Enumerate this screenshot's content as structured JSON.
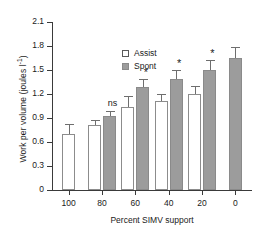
{
  "chart_data": {
    "type": "bar",
    "title": "",
    "xlabel": "Percent SIMV support",
    "ylabel": "Work per volume (joules l",
    "ylabel_sup": "-1",
    "ylabel_suffix": ")",
    "categories": [
      "100",
      "80",
      "60",
      "40",
      "20",
      "0"
    ],
    "ylim": [
      0,
      2.1
    ],
    "yticks": [
      "0",
      "0.3",
      "0.6",
      "0.9",
      "1.2",
      "1.5",
      "1.8",
      "2.1"
    ],
    "ytick_values": [
      0,
      0.3,
      0.6,
      0.9,
      1.2,
      1.5,
      1.8,
      2.1
    ],
    "grid": false,
    "legend_position": "top-left",
    "series": [
      {
        "name": "Assist",
        "color": "#ffffff",
        "values": [
          0.7,
          0.81,
          1.04,
          1.11,
          1.2,
          null
        ],
        "errors": [
          0.12,
          0.07,
          0.13,
          0.09,
          0.1,
          null
        ]
      },
      {
        "name": "Spont",
        "color": "#9c9c9c",
        "values": [
          null,
          0.93,
          1.29,
          1.39,
          1.5,
          1.65
        ],
        "errors": [
          null,
          0.06,
          0.1,
          0.11,
          0.12,
          0.14
        ]
      }
    ],
    "annotations": [
      {
        "text": "ns",
        "category": "80",
        "y": 1.06
      },
      {
        "text": "*",
        "category": "60",
        "y": 1.46
      },
      {
        "text": "*",
        "category": "40",
        "y": 1.57
      },
      {
        "text": "*",
        "category": "20",
        "y": 1.7
      }
    ]
  },
  "legend": {
    "items": [
      {
        "label": "Assist"
      },
      {
        "label": "Spont"
      }
    ]
  }
}
